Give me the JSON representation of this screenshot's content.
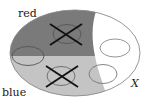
{
  "diagram": {
    "type": "set-partition",
    "labels": {
      "red": "red",
      "blue": "blue",
      "space": "X"
    },
    "colors": {
      "red_region": "#7a7a7a",
      "blue_region": "#c4c4c4",
      "background": "#ffffff",
      "outline": "#8a8a8a",
      "cross": "#111111"
    },
    "regions": [
      {
        "name": "red",
        "shade": "dark-gray"
      },
      {
        "name": "blue",
        "shade": "light-gray"
      },
      {
        "name": "uncolored",
        "shade": "white"
      }
    ],
    "subsets": [
      {
        "id": "A",
        "location": "inside red",
        "crossed": true
      },
      {
        "id": "B",
        "location": "inside blue",
        "crossed": true
      },
      {
        "id": "C",
        "location": "straddles red and blue",
        "crossed": false
      },
      {
        "id": "D",
        "location": "inside uncolored",
        "crossed": false
      },
      {
        "id": "E",
        "location": "straddles blue and uncolored",
        "crossed": false
      }
    ]
  }
}
